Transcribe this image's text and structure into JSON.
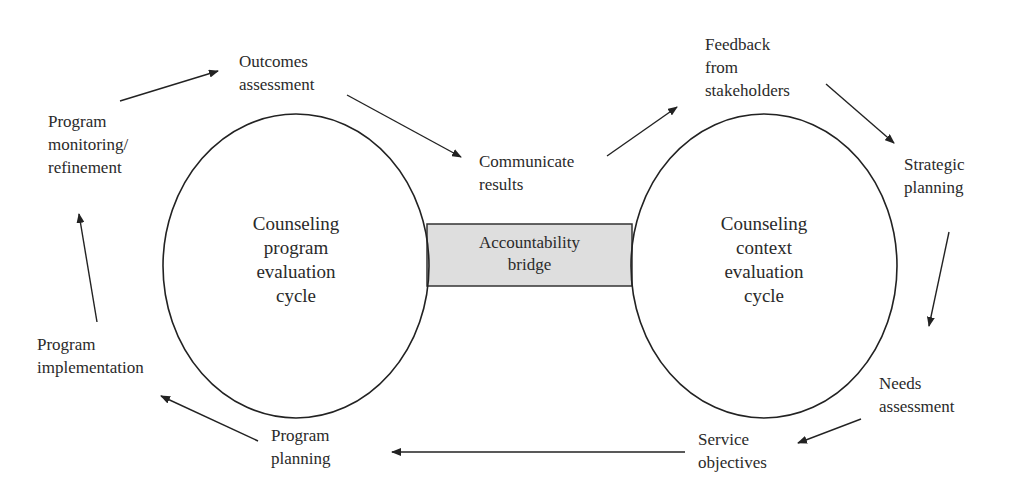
{
  "diagram": {
    "left_cycle": {
      "line1": "Counseling",
      "line2": "program",
      "line3": "evaluation",
      "line4": "cycle"
    },
    "right_cycle": {
      "line1": "Counseling",
      "line2": "context",
      "line3": "evaluation",
      "line4": "cycle"
    },
    "bridge": {
      "line1": "Accountability",
      "line2": "bridge",
      "fill": "#dedede"
    },
    "nodes": {
      "outcomes_assessment": {
        "line1": "Outcomes",
        "line2": "assessment"
      },
      "communicate_results": {
        "line1": "Communicate",
        "line2": "results"
      },
      "feedback": {
        "line1": "Feedback",
        "line2": "from",
        "line3": "stakeholders"
      },
      "strategic_planning": {
        "line1": "Strategic",
        "line2": "planning"
      },
      "needs_assessment": {
        "line1": "Needs",
        "line2": "assessment"
      },
      "service_objectives": {
        "line1": "Service",
        "line2": "objectives"
      },
      "program_planning": {
        "line1": "Program",
        "line2": "planning"
      },
      "program_implementation": {
        "line1": "Program",
        "line2": "implementation"
      },
      "program_monitoring": {
        "line1": "Program",
        "line2": "monitoring/",
        "line3": "refinement"
      }
    }
  }
}
